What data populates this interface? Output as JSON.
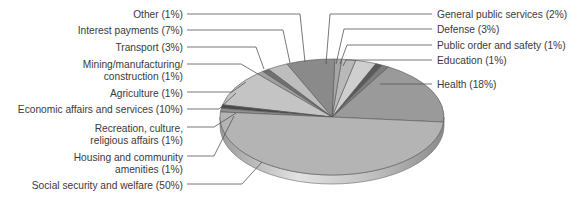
{
  "chart_data": {
    "type": "pie",
    "title": "",
    "style": "3d-tilted-grayscale",
    "slices": [
      {
        "label": "Health",
        "display": "Health (18%)",
        "value": 18,
        "color": "#9a9a9a"
      },
      {
        "label": "Education",
        "display": "Education (1%)",
        "value": 1,
        "color": "#7d7d7d"
      },
      {
        "label": "Public order and safety",
        "display": "Public order and safety (1%)",
        "value": 1,
        "color": "#5a5a5a"
      },
      {
        "label": "Defense",
        "display": "Defense (3%)",
        "value": 3,
        "color": "#cfcfcf"
      },
      {
        "label": "General public services",
        "display": "General public services (2%)",
        "value": 2,
        "color": "#b9b9b9"
      },
      {
        "label": "Other",
        "display": "Other (1%)",
        "value": 1,
        "color": "#a6a6a6"
      },
      {
        "label": "Interest payments",
        "display": "Interest payments (7%)",
        "value": 7,
        "color": "#8a8a8a"
      },
      {
        "label": "Transport",
        "display": "Transport (3%)",
        "value": 3,
        "color": "#bdbdbd"
      },
      {
        "label": "Mining/manufacturing/construction",
        "display": "Mining/manufacturing/\nconstruction (1%)",
        "value": 1,
        "color": "#707070"
      },
      {
        "label": "Agriculture",
        "display": "Agriculture (1%)",
        "value": 1,
        "color": "#a0a0a0"
      },
      {
        "label": "Economic affairs and services",
        "display": "Economic affairs and services (10%)",
        "value": 10,
        "color": "#c4c4c4"
      },
      {
        "label": "Recreation, culture, religious affairs",
        "display": "Recreation, culture,\nreligious affairs (1%)",
        "value": 1,
        "color": "#4a4a4a"
      },
      {
        "label": "Housing and community amenities",
        "display": "Housing and community\namenities (1%)",
        "value": 1,
        "color": "#8f8f8f"
      },
      {
        "label": "Social security and welfare",
        "display": "Social security and welfare (50%)",
        "value": 50,
        "color": "#b4b4b4"
      }
    ],
    "legend_position": "leader-line labels"
  },
  "labels_right": [
    {
      "id": "general",
      "text": "General public services (2%)",
      "x": 437,
      "y": 14
    },
    {
      "id": "defense",
      "text": "Defense (3%)",
      "x": 437,
      "y": 29
    },
    {
      "id": "public-order",
      "text": "Public order and safety (1%)",
      "x": 437,
      "y": 45
    },
    {
      "id": "education",
      "text": "Education (1%)",
      "x": 437,
      "y": 60
    },
    {
      "id": "health",
      "text": "Health (18%)",
      "x": 437,
      "y": 84
    }
  ],
  "labels_left": [
    {
      "id": "other",
      "lines": [
        "Other (1%)"
      ],
      "right": 183,
      "y": 14
    },
    {
      "id": "interest",
      "lines": [
        "Interest payments (7%)"
      ],
      "right": 183,
      "y": 30
    },
    {
      "id": "transport",
      "lines": [
        "Transport (3%)"
      ],
      "right": 183,
      "y": 47
    },
    {
      "id": "mining",
      "lines": [
        "Mining/manufacturing/",
        "construction (1%)"
      ],
      "right": 183,
      "y": 64
    },
    {
      "id": "agriculture",
      "lines": [
        "Agriculture (1%)"
      ],
      "right": 183,
      "y": 92
    },
    {
      "id": "economic",
      "lines": [
        "Economic affairs and services (10%)"
      ],
      "right": 183,
      "y": 109
    },
    {
      "id": "recreation",
      "lines": [
        "Recreation, culture,",
        "religious affairs (1%)"
      ],
      "right": 183,
      "y": 127
    },
    {
      "id": "housing",
      "lines": [
        "Housing and community",
        "amenities (1%)"
      ],
      "right": 183,
      "y": 156
    },
    {
      "id": "social",
      "lines": [
        "Social security and welfare (50%)"
      ],
      "right": 183,
      "y": 184
    }
  ]
}
